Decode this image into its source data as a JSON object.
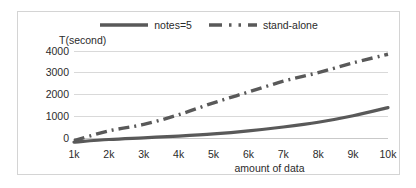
{
  "chart_data": {
    "type": "line",
    "title": "",
    "xlabel": "amount of data",
    "ylabel": "T(second)",
    "x": [
      1,
      2,
      3,
      4,
      5,
      6,
      7,
      8,
      9,
      10
    ],
    "categories": [
      "1k",
      "2k",
      "3k",
      "4k",
      "5k",
      "6k",
      "7k",
      "8k",
      "9k",
      "10k"
    ],
    "series": [
      {
        "name": "notes=5",
        "style": "solid",
        "color": "#595959",
        "values": [
          180,
          300,
          380,
          460,
          560,
          700,
          880,
          1100,
          1400,
          1780
        ]
      },
      {
        "name": "stand-alone",
        "style": "dash-dot",
        "color": "#595959",
        "values": [
          250,
          700,
          1000,
          1450,
          2000,
          2500,
          3000,
          3400,
          3850,
          4250
        ]
      }
    ],
    "ylim": [
      0,
      4400
    ],
    "xlim": [
      1,
      10
    ],
    "yticks": [
      0,
      1000,
      2000,
      3000,
      4000
    ],
    "ytick_labels": [
      "0",
      "1000",
      "2000",
      "3000",
      "4000"
    ],
    "grid": true,
    "grid_axis": "y",
    "legend_position": "top-center"
  },
  "legend": {
    "entries": [
      {
        "label": "notes=5",
        "icon": "solid-line-swatch"
      },
      {
        "label": "stand-alone",
        "icon": "dash-dot-line-swatch"
      }
    ]
  },
  "colors": {
    "series_line": "#595959",
    "gridline": "#d9d9d9",
    "border": "#d4d4d4",
    "text": "#2b2b2b",
    "background": "#ffffff"
  }
}
